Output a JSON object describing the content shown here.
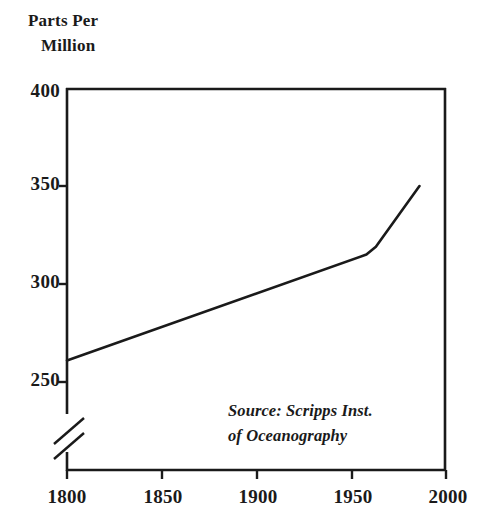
{
  "chart_data": {
    "type": "line",
    "title_line1": "Parts Per",
    "title_line2": "Million",
    "xlabel": "",
    "ylabel": "Parts Per Million",
    "xlim": [
      1800,
      2000
    ],
    "ylim": [
      240,
      400
    ],
    "y_axis_break": true,
    "y_axis_break_note": "axis broken below 250",
    "grid": false,
    "legend": false,
    "x_ticks": [
      1800,
      1850,
      1900,
      1950,
      2000
    ],
    "x_tick_labels": [
      "1800",
      "1850",
      "1900",
      "1950",
      "2000"
    ],
    "y_ticks": [
      250,
      300,
      350,
      400
    ],
    "y_tick_labels": [
      "250",
      "300",
      "350",
      "400"
    ],
    "series": [
      {
        "name": "Atmospheric CO2 concentration",
        "x": [
          1800,
          1958,
          1963,
          1986
        ],
        "values": [
          261,
          315,
          319,
          350
        ]
      }
    ],
    "annotations": [
      {
        "name": "source",
        "line1": "Source: Scripps Inst.",
        "line2": "of Oceanography",
        "text": "Source: Scripps Inst. of Oceanography"
      }
    ],
    "colors": {
      "background": "#ffffff",
      "axis": "#1a1a1a",
      "line": "#1a1a1a",
      "text": "#1a1a1a"
    }
  },
  "axis": {
    "y_labels": [
      "400",
      "350",
      "300",
      "250"
    ],
    "x_labels": [
      "1800",
      "1850",
      "1900",
      "1950",
      "2000"
    ]
  },
  "title": {
    "line1": "Parts Per",
    "line2": "Million"
  },
  "source": {
    "line1": "Source: Scripps Inst.",
    "line2": "of Oceanography"
  }
}
